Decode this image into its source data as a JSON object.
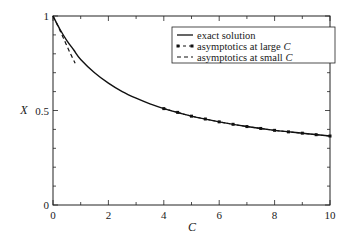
{
  "chart_data": {
    "type": "line",
    "title": "",
    "xlabel": "C",
    "ylabel": "X",
    "xlim": [
      0,
      10
    ],
    "ylim": [
      0,
      1
    ],
    "xticks": [
      0,
      2,
      4,
      6,
      8,
      10
    ],
    "xtick_labels": [
      "0",
      "2",
      "4",
      "6",
      "8",
      "10"
    ],
    "yticks": [
      0,
      0.5,
      1
    ],
    "ytick_labels": [
      "0",
      "0.5",
      "1"
    ],
    "x_minor_step": 1,
    "y_minor_step": 0.1,
    "grid": false,
    "legend_position": "top-right",
    "series": [
      {
        "name": "exact solution",
        "legend_label": "exact solution",
        "style": "solid",
        "x": [
          0,
          0.25,
          0.5,
          0.75,
          1,
          1.5,
          2,
          2.5,
          3,
          3.5,
          4,
          5,
          6,
          7,
          8,
          9,
          10
        ],
        "y": [
          1.0,
          0.93,
          0.87,
          0.82,
          0.77,
          0.7,
          0.645,
          0.6,
          0.565,
          0.535,
          0.51,
          0.47,
          0.44,
          0.415,
          0.395,
          0.38,
          0.365
        ]
      },
      {
        "name": "asymptotics at large C",
        "legend_label_prefix": "asymptotics at large ",
        "legend_label_var": "C",
        "style": "dot-dash",
        "x": [
          4,
          4.5,
          5,
          5.5,
          6,
          6.5,
          7,
          7.5,
          8,
          8.5,
          9,
          9.5,
          10
        ],
        "y": [
          0.51,
          0.49,
          0.47,
          0.455,
          0.44,
          0.427,
          0.415,
          0.405,
          0.395,
          0.387,
          0.38,
          0.372,
          0.365
        ]
      },
      {
        "name": "asymptotics at small C",
        "legend_label_prefix": "asymptotics at small ",
        "legend_label_var": "C",
        "style": "dashed",
        "x": [
          0,
          0.2,
          0.4,
          0.6,
          0.8
        ],
        "y": [
          1.0,
          0.94,
          0.875,
          0.81,
          0.75
        ]
      }
    ]
  }
}
